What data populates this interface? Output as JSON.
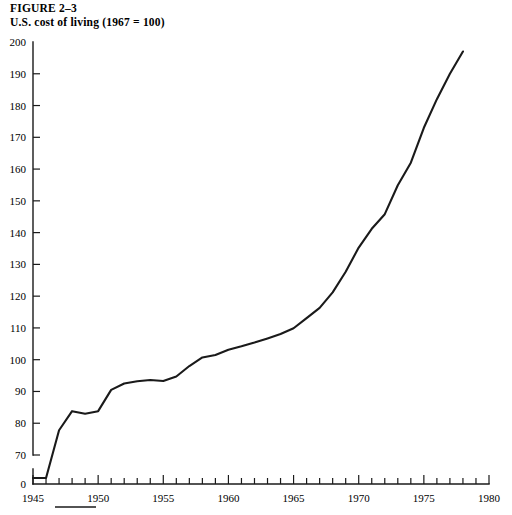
{
  "caption": {
    "figure_number": "FIGURE 2–3",
    "title": "U.S. cost of living (1967 = 100)"
  },
  "chart_data": {
    "type": "line",
    "title": "U.S. cost of living (1967 = 100)",
    "xlabel": "",
    "ylabel": "",
    "grid": false,
    "legend": null,
    "xlim": [
      1945,
      1980
    ],
    "ylim": [
      70,
      200
    ],
    "y_axis_break": true,
    "y_break_note": "Axis is broken: a 0 label sits below the 70 tick at the baseline.",
    "yticks": [
      70,
      80,
      90,
      100,
      110,
      120,
      130,
      140,
      150,
      160,
      170,
      180,
      190,
      200
    ],
    "ytick_labels": [
      "70",
      "80",
      "90",
      "100",
      "110",
      "120",
      "130",
      "140",
      "150",
      "160",
      "170",
      "180",
      "190",
      "200"
    ],
    "y_zero_label": "0",
    "xticks": [
      1945,
      1950,
      1955,
      1960,
      1965,
      1970,
      1975,
      1980
    ],
    "xtick_labels": [
      "1945",
      "1950",
      "1955",
      "1960",
      "1965",
      "1970",
      "1975",
      "1980"
    ],
    "x_minor_tick_interval": 1,
    "series": [
      {
        "name": "U.S. cost of living index",
        "x": [
          1945,
          1946,
          1947,
          1948,
          1949,
          1950,
          1951,
          1952,
          1953,
          1954,
          1955,
          1956,
          1957,
          1958,
          1959,
          1960,
          1961,
          1962,
          1963,
          1964,
          1965,
          1966,
          1967,
          1968,
          1969,
          1970,
          1971,
          1972,
          1973,
          1974,
          1975,
          1976,
          1977,
          1978
        ],
        "values": [
          62.0,
          68.0,
          77.8,
          83.8,
          83.0,
          83.8,
          90.5,
          92.5,
          93.2,
          93.6,
          93.3,
          94.7,
          98.0,
          100.7,
          101.5,
          103.1,
          104.2,
          105.4,
          106.7,
          108.1,
          109.9,
          113.1,
          116.3,
          121.2,
          127.7,
          135.3,
          141.2,
          145.8,
          154.9,
          162.0,
          173.0,
          182.0,
          190.0,
          197.0
        ]
      }
    ]
  },
  "axis_rule": {
    "present": true,
    "description": "short horizontal rule beneath the 1945 tick area"
  }
}
